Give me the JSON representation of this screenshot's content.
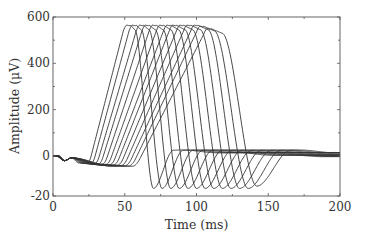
{
  "chart_data": {
    "type": "line",
    "title": "",
    "xlabel": "Time (ms)",
    "ylabel": "Amplitude (μV)",
    "xlim": [
      0,
      200
    ],
    "ylim_labels": [
      "-20",
      "0",
      "200",
      "400",
      "600"
    ],
    "x_ticks": [
      0,
      50,
      100,
      150,
      200
    ],
    "x_minor_ticks": [
      25,
      75,
      125,
      175
    ],
    "y_ticks": [
      {
        "label": "600",
        "value": 600
      },
      {
        "label": "400",
        "value": 400
      },
      {
        "label": "200",
        "value": 200
      },
      {
        "label": "0",
        "value": 0
      },
      {
        "label": "-20",
        "value": -170
      }
    ],
    "y_minor_ticks": [
      500,
      300,
      100
    ],
    "grid": false,
    "legend": null,
    "line_color": "#333333",
    "series_description": "13 overlapping action-potential-like traces, each shifted ~8.5 ms later; small negative pre-dip near -20 μV, rise to ~565 μV peak, sharp fall to ~-140 μV trough, then recovery to ~0 with small overshoot.",
    "series": [
      {
        "name": "trace 1",
        "onset_ms": 18,
        "peak_ms": 52,
        "peak_uv": 565,
        "trough_ms": 70,
        "trough_uv": -140
      },
      {
        "name": "trace 2",
        "onset_ms": 20,
        "peak_ms": 56,
        "peak_uv": 565,
        "trough_ms": 76,
        "trough_uv": -140
      },
      {
        "name": "trace 3",
        "onset_ms": 22,
        "peak_ms": 61,
        "peak_uv": 565,
        "trough_ms": 82,
        "trough_uv": -140
      },
      {
        "name": "trace 4",
        "onset_ms": 24,
        "peak_ms": 65,
        "peak_uv": 565,
        "trough_ms": 88,
        "trough_uv": -140
      },
      {
        "name": "trace 5",
        "onset_ms": 26,
        "peak_ms": 70,
        "peak_uv": 565,
        "trough_ms": 94,
        "trough_uv": -140
      },
      {
        "name": "trace 6",
        "onset_ms": 28,
        "peak_ms": 75,
        "peak_uv": 565,
        "trough_ms": 100,
        "trough_uv": -140
      },
      {
        "name": "trace 7",
        "onset_ms": 30,
        "peak_ms": 80,
        "peak_uv": 565,
        "trough_ms": 106,
        "trough_uv": -140
      },
      {
        "name": "trace 8",
        "onset_ms": 32,
        "peak_ms": 84,
        "peak_uv": 565,
        "trough_ms": 112,
        "trough_uv": -140
      },
      {
        "name": "trace 9",
        "onset_ms": 34,
        "peak_ms": 89,
        "peak_uv": 565,
        "trough_ms": 118,
        "trough_uv": -140
      },
      {
        "name": "trace 10",
        "onset_ms": 36,
        "peak_ms": 94,
        "peak_uv": 565,
        "trough_ms": 124,
        "trough_uv": -140
      },
      {
        "name": "trace 11",
        "onset_ms": 38,
        "peak_ms": 99,
        "peak_uv": 565,
        "trough_ms": 130,
        "trough_uv": -140
      },
      {
        "name": "trace 12",
        "onset_ms": 40,
        "peak_ms": 103,
        "peak_uv": 560,
        "trough_ms": 136,
        "trough_uv": -140
      },
      {
        "name": "trace 13",
        "onset_ms": 42,
        "peak_ms": 108,
        "peak_uv": 550,
        "trough_ms": 142,
        "trough_uv": -130
      }
    ]
  }
}
